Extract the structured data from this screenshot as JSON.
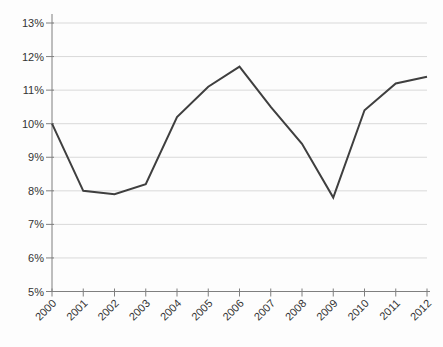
{
  "page": {
    "background_color": "#fdfdfd"
  },
  "chart_data": {
    "type": "line",
    "title": "",
    "xlabel": "",
    "ylabel": "",
    "categories": [
      "2000",
      "2001",
      "2002",
      "2003",
      "2004",
      "2005",
      "2006",
      "2007",
      "2008",
      "2009",
      "2010",
      "2011",
      "2012"
    ],
    "series": [
      {
        "name": "percentage-rate",
        "values": [
          10.0,
          8.0,
          7.9,
          8.2,
          10.2,
          11.1,
          11.7,
          10.5,
          9.4,
          7.8,
          10.4,
          11.2,
          11.4
        ]
      }
    ],
    "ylim": [
      5,
      13
    ],
    "ytick_labels": [
      "5%",
      "6%",
      "7%",
      "8%",
      "9%",
      "10%",
      "11%",
      "12%",
      "13%"
    ],
    "grid": true,
    "legend_position": "none",
    "x_label_rotation_deg": 45,
    "colors": {
      "line": "#3f3f3f",
      "gridline": "#d9d9d9",
      "axis": "#7f7f7f",
      "tick_label": "#333333"
    }
  }
}
